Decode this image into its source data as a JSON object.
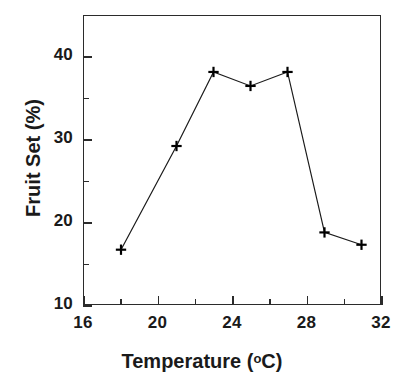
{
  "chart_data": {
    "type": "line",
    "title": "",
    "subtitle": "",
    "xlabel_text": "Temperature (",
    "xlabel_sup": "o",
    "xlabel_tail": "C)",
    "xlabel": "Temperature (oC)",
    "ylabel": "Fruit Set  (%)",
    "xlim": [
      16,
      32
    ],
    "ylim": [
      10,
      45
    ],
    "x_major_ticks": [
      16,
      20,
      24,
      28,
      32
    ],
    "x_minor_ticks": [
      18,
      22,
      26,
      30
    ],
    "y_major_ticks": [
      10,
      20,
      30,
      40
    ],
    "y_minor_ticks": [
      15,
      25,
      35
    ],
    "x_tick_labels": [
      "16",
      "20",
      "24",
      "28",
      "32"
    ],
    "y_tick_labels": [
      "10",
      "20",
      "30",
      "40"
    ],
    "grid": false,
    "legend": null,
    "marker": "plus",
    "line_color": "#1a1a1a",
    "marker_color": "#000000",
    "x": [
      18,
      21,
      23,
      25,
      27,
      29,
      31
    ],
    "values": [
      16.6,
      29.2,
      38.2,
      36.5,
      38.2,
      18.7,
      17.2
    ],
    "series": [
      {
        "name": "Fruit Set",
        "points": [
          {
            "x": 18,
            "y": 16.6
          },
          {
            "x": 21,
            "y": 29.2
          },
          {
            "x": 23,
            "y": 38.2
          },
          {
            "x": 25,
            "y": 36.5
          },
          {
            "x": 27,
            "y": 38.2
          },
          {
            "x": 29,
            "y": 18.7
          },
          {
            "x": 31,
            "y": 17.2
          }
        ]
      }
    ],
    "annotations": []
  }
}
